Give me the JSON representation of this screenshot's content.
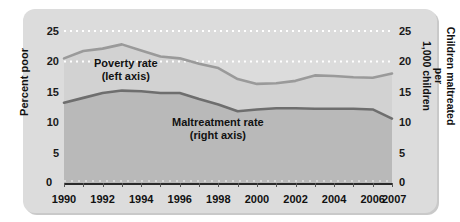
{
  "chart_data": {
    "type": "line",
    "title": "",
    "subtitle": "",
    "xlabel": "",
    "ylabel": "Percent poor",
    "ylabel_right": "Children maltreated per 1,000 children",
    "xlim": [
      1990,
      2007
    ],
    "ylim": [
      0,
      25
    ],
    "ylim_right": [
      0,
      25
    ],
    "grid": true,
    "grid_lines": [
      25,
      20
    ],
    "legend": "inline-annotations",
    "x": [
      1990,
      1991,
      1992,
      1993,
      1994,
      1995,
      1996,
      1997,
      1998,
      1999,
      2000,
      2001,
      2002,
      2003,
      2004,
      2005,
      2006,
      2007
    ],
    "x_tick_labels": [
      "1990",
      "1992",
      "1994",
      "1996",
      "1998",
      "2000",
      "2002",
      "2004",
      "2006",
      "2007"
    ],
    "y_tick_labels_left": [
      "0",
      "5",
      "10",
      "15",
      "20",
      "25"
    ],
    "y_tick_labels_right": [
      "0",
      "5",
      "10",
      "15",
      "20",
      "25"
    ],
    "series": [
      {
        "name": "Poverty rate",
        "axis": "left",
        "annotation": "Poverty rate",
        "annotation_sub": "(left axis)",
        "color": "#9a9a9a",
        "values": [
          20.5,
          21.7,
          22.1,
          22.8,
          21.8,
          20.8,
          20.5,
          19.6,
          18.9,
          17.1,
          16.3,
          16.4,
          16.8,
          17.7,
          17.6,
          17.4,
          17.3,
          18.0
        ]
      },
      {
        "name": "Maltreatment rate",
        "axis": "right",
        "annotation": "Maltreatment rate",
        "annotation_sub": "(right axis)",
        "color": "#6e6e6e",
        "values": [
          13.2,
          14.0,
          14.8,
          15.2,
          15.1,
          14.8,
          14.8,
          13.8,
          12.9,
          11.8,
          12.1,
          12.3,
          12.3,
          12.2,
          12.2,
          12.2,
          12.1,
          10.6
        ]
      }
    ]
  },
  "axes": {
    "left_title": "Percent poor",
    "right_title_line1": "Children maltreated per",
    "right_title_line2": "1,000 children",
    "zero_left": "0",
    "zero_right": "0"
  },
  "colors": {
    "card_background": "#dcdcdc",
    "plot_upper_band": "#d2d2d2",
    "plot_lower_band": "#b9b9b9",
    "poverty_line": "#9a9a9a",
    "maltreatment_line": "#6e6e6e",
    "gridline": "#ffffff",
    "text": "#111111",
    "axis": "#2a2a2a"
  }
}
